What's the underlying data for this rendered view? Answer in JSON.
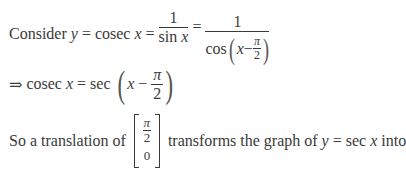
{
  "line1": {
    "consider": "Consider",
    "y": "y",
    "eq1": "=",
    "cosec": "cosec",
    "x1": "x",
    "eq2": "=",
    "frac1_num": "1",
    "frac1_den_fn": "sin",
    "frac1_den_var": "x",
    "eq3": "=",
    "frac2_num": "1",
    "frac2_den_fn": "cos",
    "frac2_den_var": "x",
    "frac2_minus": "−",
    "pi": "π",
    "two": "2"
  },
  "line2": {
    "implies": "⇒",
    "cosec": "cosec",
    "x": "x",
    "eq": "=",
    "sec": "sec",
    "x2": "x",
    "minus": "−",
    "pi": "π",
    "two": "2"
  },
  "line3": {
    "lead": "So a translation of",
    "vec_pi": "π",
    "vec_two": "2",
    "vec_zero": "0",
    "mid": "transforms the graph of",
    "y": "y",
    "eq": "=",
    "sec": "sec",
    "x": "x",
    "tail": "into"
  }
}
